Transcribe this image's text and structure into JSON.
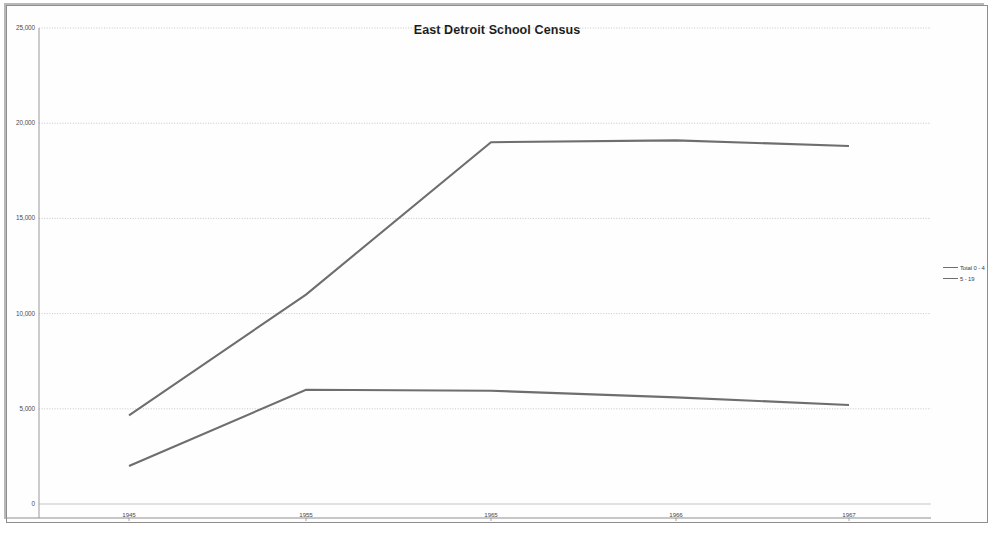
{
  "chart_data": {
    "type": "line",
    "title": "East Detroit School Census",
    "xlabel": "",
    "ylabel": "",
    "categories": [
      "1945",
      "1955",
      "1965",
      "1966",
      "1967"
    ],
    "x_tick_labels": [
      "1945",
      "1955",
      "1965",
      "1966",
      "1967"
    ],
    "y_tick_labels": [
      "0",
      "5,000",
      "10,000",
      "15,000",
      "20,000",
      "25,000"
    ],
    "y_tick_values": [
      0,
      5000,
      10000,
      15000,
      20000,
      25000
    ],
    "ylim": [
      0,
      25000
    ],
    "grid": "horizontal-dotted",
    "legend_position": "right",
    "series": [
      {
        "name": "Total 0 - 4",
        "color": "#6e6e6e",
        "values": [
          4650,
          11000,
          19000,
          19100,
          18800
        ]
      },
      {
        "name": "5 - 19",
        "color": "#6e6e6e",
        "values": [
          2000,
          6000,
          5950,
          5600,
          5200
        ]
      }
    ]
  },
  "legend": {
    "items": [
      {
        "label": "Total 0 - 4"
      },
      {
        "label": "5 - 19"
      }
    ]
  }
}
